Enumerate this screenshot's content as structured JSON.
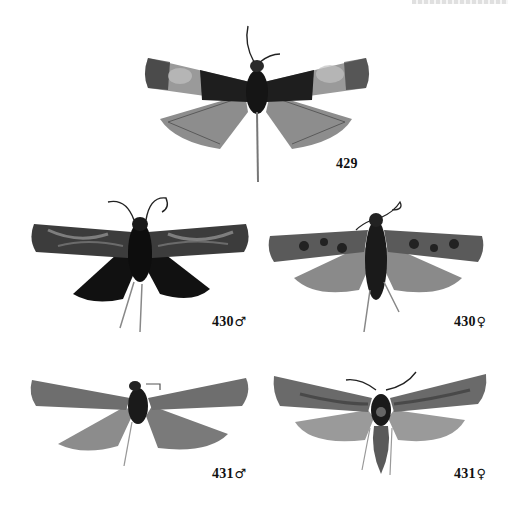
{
  "plate": {
    "header_text_visible": "",
    "figures": [
      {
        "id": "429",
        "number": "429",
        "sex_symbol": ""
      },
      {
        "id": "430m",
        "number": "430",
        "sex_symbol": "♂"
      },
      {
        "id": "430f",
        "number": "430",
        "sex_symbol": "♀"
      },
      {
        "id": "431m",
        "number": "431",
        "sex_symbol": "♂"
      },
      {
        "id": "431f",
        "number": "431",
        "sex_symbol": "♀"
      }
    ]
  },
  "colors": {
    "background": "#ffffff",
    "label_text": "#111111",
    "wing_dark": "#1e1e1e",
    "wing_mid": "#6d6d6d",
    "wing_light": "#a8a8a8",
    "hindwing": "#8a8a8a"
  }
}
